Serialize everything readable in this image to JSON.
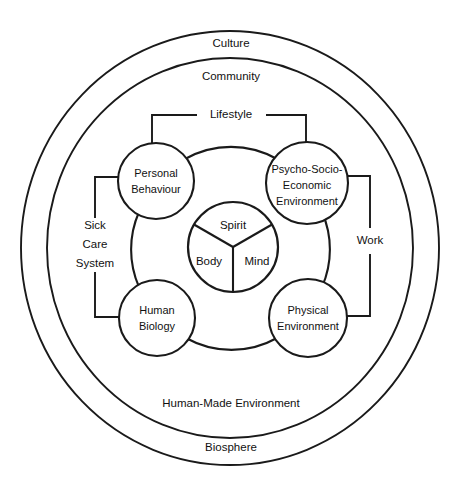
{
  "diagram": {
    "background_color": "#ffffff",
    "line_color": "#1a1a1a",
    "text_color": "#111111",
    "rings": [
      {
        "id": "culture",
        "label": "Culture"
      },
      {
        "id": "community",
        "label": "Community"
      },
      {
        "id": "human-made-environment",
        "label": "Human-Made Environment"
      },
      {
        "id": "biosphere",
        "label": "Biosphere"
      }
    ],
    "nodes": [
      {
        "id": "personal-behaviour",
        "line1": "Personal",
        "line2": "Behaviour"
      },
      {
        "id": "psycho-socio-economic-environment",
        "line1": "Psycho-Socio-",
        "line2": "Economic",
        "line3": "Environment"
      },
      {
        "id": "human-biology",
        "line1": "Human",
        "line2": "Biology"
      },
      {
        "id": "physical-environment",
        "line1": "Physical",
        "line2": "Environment"
      }
    ],
    "core": {
      "spirit": "Spirit",
      "body": "Body",
      "mind": "Mind"
    },
    "brackets": [
      {
        "id": "lifestyle",
        "label": "Lifestyle"
      },
      {
        "id": "sick-care-system",
        "line1": "Sick",
        "line2": "Care",
        "line3": "System"
      },
      {
        "id": "work",
        "label": "Work"
      }
    ]
  }
}
